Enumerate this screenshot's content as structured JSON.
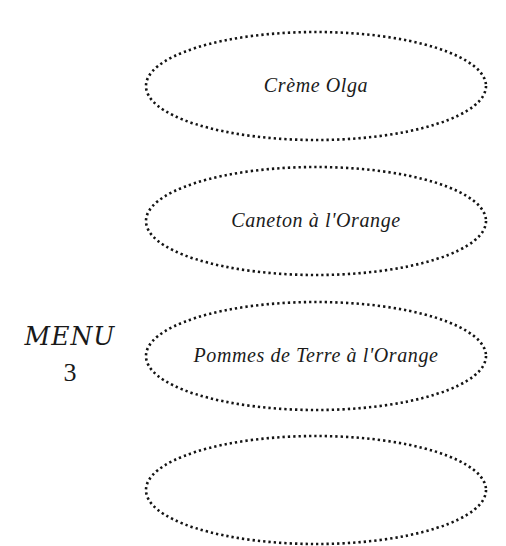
{
  "page": {
    "background_color": "#ffffff",
    "ink_color": "#1a1a1a",
    "document_type": "menu"
  },
  "heading": {
    "title": "MENU",
    "number": "3"
  },
  "menu_items": [
    {
      "label": "Crème Olga"
    },
    {
      "label": "Caneton à l'Orange"
    },
    {
      "label": "Pommes de Terre à l'Orange"
    },
    {
      "label": ""
    }
  ]
}
